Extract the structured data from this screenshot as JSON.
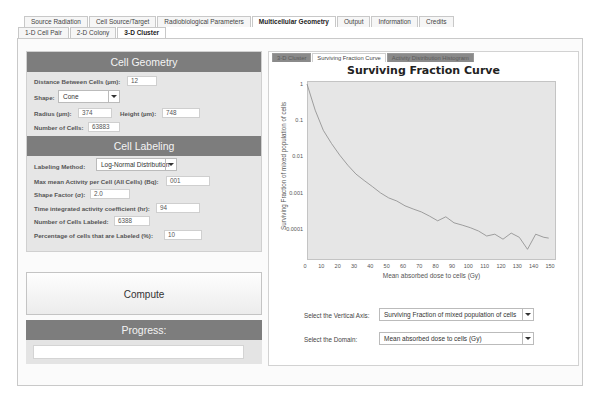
{
  "top_tabs": [
    {
      "label": "Source Radiation",
      "active": false
    },
    {
      "label": "Cell Source/Target",
      "active": false
    },
    {
      "label": "Radiobiological Parameters",
      "active": false
    },
    {
      "label": "Multicellular Geometry",
      "active": true
    },
    {
      "label": "Output",
      "active": false
    },
    {
      "label": "Information",
      "active": false
    },
    {
      "label": "Credits",
      "active": false
    }
  ],
  "sub_tabs": [
    {
      "label": "1-D Cell Pair",
      "active": false
    },
    {
      "label": "2-D Colony",
      "active": false
    },
    {
      "label": "3-D Cluster",
      "active": true
    }
  ],
  "cell_geometry": {
    "title": "Cell Geometry",
    "distance_label": "Distance Between Cells (µm):",
    "distance_value": "12",
    "shape_label": "Shape:",
    "shape_value": "Cone",
    "radius_label": "Radius (µm):",
    "radius_value": "374",
    "height_label": "Height (µm):",
    "height_value": "748",
    "num_cells_label": "Number of Cells:",
    "num_cells_value": "63883"
  },
  "cell_labeling": {
    "title": "Cell Labeling",
    "method_label": "Labeling Method:",
    "method_value": "Log-Normal Distribution",
    "max_activity_label": "Max mean Activity per Cell (All Cells) (Bq):",
    "max_activity_value": "001",
    "shape_factor_label": "Shape Factor (σ):",
    "shape_factor_value": "2.0",
    "time_coeff_label": "Time integrated activity coefficient (hr):",
    "time_coeff_value": "94",
    "num_labeled_label": "Number of Cells Labeled:",
    "num_labeled_value": "6388",
    "pct_labeled_label": "Percentage of cells that are Labeled (%):",
    "pct_labeled_value": "10"
  },
  "compute_label": "Compute",
  "progress": {
    "title": "Progress:",
    "value": ""
  },
  "chart_tabs": [
    {
      "label": "3-D Cluster",
      "active": false
    },
    {
      "label": "Surviving Fraction Curve",
      "active": true
    },
    {
      "label": "Activity Distribution Histogram",
      "active": false
    }
  ],
  "controls": {
    "vertical_axis_label": "Select the Vertical Axis:",
    "vertical_axis_value": "Surviving Fraction of mixed population of cells",
    "domain_label": "Select the Domain:",
    "domain_value": "Mean absorbed dose to cells (Gy)"
  },
  "colors": {
    "header_bg": "#7d7d7d",
    "panel_bg": "#e6e6e6",
    "plot_bg": "#e6e6e6",
    "curve": "#8a8a8a"
  },
  "chart_data": {
    "type": "line",
    "title": "Surviving Fraction Curve",
    "xlabel": "Mean absorbed dose to cells (Gy)",
    "ylabel": "Surviving Fraction of mixed population of cells",
    "yscale": "log",
    "xlim": [
      0,
      152
    ],
    "ylim": [
      2e-05,
      1
    ],
    "grid": false,
    "x_ticks": [
      "0",
      "10",
      "20",
      "30",
      "40",
      "50",
      "60",
      "70",
      "80",
      "90",
      "100",
      "110",
      "120",
      "130",
      "140",
      "150"
    ],
    "y_ticks": [
      "1",
      "0.1",
      "0.01",
      "0.001",
      "0.0001"
    ],
    "series": [
      {
        "name": "Surviving Fraction",
        "x": [
          0,
          5,
          10,
          15,
          20,
          25,
          30,
          35,
          40,
          45,
          50,
          55,
          60,
          65,
          70,
          75,
          80,
          85,
          90,
          95,
          100,
          105,
          110,
          115,
          120,
          125,
          130,
          135,
          140,
          145,
          148
        ],
        "values": [
          1,
          0.19,
          0.053,
          0.023,
          0.011,
          0.0058,
          0.0033,
          0.0022,
          0.0015,
          0.001,
          0.00073,
          0.0006,
          0.00044,
          0.00036,
          0.0003,
          0.00023,
          0.00017,
          0.00022,
          0.00015,
          0.00013,
          0.00011,
          8.9e-05,
          6.5e-05,
          7.3e-05,
          5.3e-05,
          7.8e-05,
          6e-05,
          2.8e-05,
          7.3e-05,
          6e-05,
          5.7e-05
        ]
      }
    ]
  }
}
